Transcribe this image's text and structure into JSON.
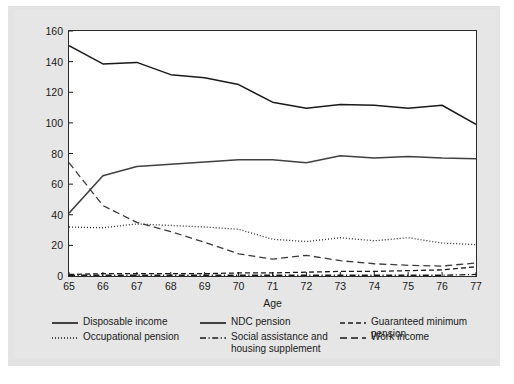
{
  "chart_data": {
    "type": "line",
    "title": "",
    "xlabel": "Age",
    "ylabel": "Percent of median disposable income",
    "x": [
      65,
      66,
      67,
      68,
      69,
      70,
      71,
      72,
      73,
      74,
      75,
      76,
      77
    ],
    "xlim": [
      65,
      77
    ],
    "ylim": [
      0,
      160
    ],
    "yticks": [
      0,
      20,
      40,
      60,
      80,
      100,
      120,
      140,
      160
    ],
    "xticks": [
      65,
      66,
      67,
      68,
      69,
      70,
      71,
      72,
      73,
      74,
      75,
      76,
      77
    ],
    "grid": false,
    "legend_position": "below-axes",
    "series": [
      {
        "name": "Disposable income",
        "style": "solid",
        "color": "#1a1a1a",
        "values": [
          150.5,
          138.5,
          139.5,
          131.5,
          129.5,
          125.0,
          113.5,
          109.5,
          112.0,
          111.5,
          109.5,
          111.5,
          99.0
        ]
      },
      {
        "name": "NDC pension",
        "style": "solid",
        "color": "#404040",
        "values": [
          41.0,
          65.5,
          71.5,
          73.0,
          74.5,
          76.0,
          76.0,
          74.0,
          78.5,
          77.0,
          78.0,
          77.0,
          76.5
        ]
      },
      {
        "name": "Guaranteed minimum pension",
        "style": "dashed",
        "color": "#1a1a1a",
        "values": [
          1.0,
          1.5,
          1.5,
          1.5,
          1.5,
          2.0,
          2.0,
          2.5,
          3.0,
          3.0,
          3.5,
          4.0,
          6.0
        ]
      },
      {
        "name": "Occupational pension",
        "style": "dotted",
        "color": "#2b2b2b",
        "values": [
          32.0,
          31.5,
          34.0,
          33.0,
          32.0,
          30.5,
          24.0,
          22.5,
          25.0,
          23.0,
          25.0,
          21.5,
          20.5
        ]
      },
      {
        "name": "Social assistance and\nhousing supplement",
        "style": "dashdot",
        "color": "#1a1a1a",
        "values": [
          0.5,
          0.5,
          0.5,
          0.5,
          0.5,
          0.5,
          0.5,
          0.5,
          0.5,
          0.5,
          0.5,
          0.5,
          1.0
        ]
      },
      {
        "name": "Work income",
        "style": "longdash",
        "color": "#3a3a3a",
        "values": [
          74.0,
          46.0,
          35.0,
          29.0,
          22.0,
          14.5,
          11.0,
          13.5,
          10.0,
          8.0,
          7.0,
          6.5,
          8.5
        ]
      }
    ]
  },
  "axes": {
    "y_title": "Percent of median disposable income",
    "x_title": "Age",
    "y_tick_labels": [
      "160",
      "140",
      "120",
      "100",
      "80",
      "60",
      "40",
      "20",
      "0"
    ],
    "x_tick_labels": [
      "65",
      "66",
      "67",
      "68",
      "69",
      "70",
      "71",
      "72",
      "73",
      "74",
      "75",
      "76",
      "77"
    ]
  },
  "legend": {
    "items": [
      {
        "label": "Disposable income",
        "style": "solid"
      },
      {
        "label": "NDC pension",
        "style": "solid"
      },
      {
        "label": "Guaranteed minimum pension",
        "style": "dashed"
      },
      {
        "label": "Occupational pension",
        "style": "dotted"
      },
      {
        "label": "Social assistance and\nhousing supplement",
        "style": "dashdot"
      },
      {
        "label": "Work income",
        "style": "longdash"
      }
    ]
  },
  "colors": {
    "ink": "#1a1a1a",
    "panel": "#ffffff",
    "page": "#e6e6e6"
  }
}
